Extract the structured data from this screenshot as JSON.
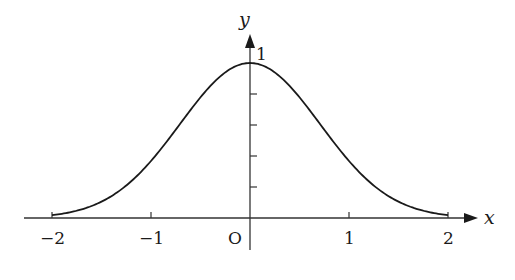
{
  "chart_data": {
    "type": "line",
    "title": "",
    "xlabel": "x",
    "ylabel": "y",
    "function": "y = e^(-x^2)",
    "xlim": [
      -2,
      2
    ],
    "ylim": [
      0,
      1
    ],
    "x_ticks": [
      -2,
      -1,
      0,
      1,
      2
    ],
    "x_tick_labels": [
      "−2",
      "−1",
      "O",
      "1",
      "2"
    ],
    "y_ticks": [
      0.2,
      0.4,
      0.6,
      0.8,
      1
    ],
    "y_tick_labels": [
      "1"
    ],
    "grid": false,
    "legend": null,
    "series": [
      {
        "name": "curve",
        "x": [
          -2,
          -1.5,
          -1,
          -0.5,
          0,
          0.5,
          1,
          1.5,
          2
        ],
        "values": [
          0.018,
          0.105,
          0.368,
          0.779,
          1.0,
          0.779,
          0.368,
          0.105,
          0.018
        ]
      }
    ]
  },
  "labels": {
    "x_axis": "x",
    "y_axis": "y",
    "origin": "O",
    "x_neg2": "−2",
    "x_neg1": "−1",
    "x_1": "1",
    "x_2": "2",
    "y_1": "1"
  },
  "colors": {
    "curve": "#1a1a1a",
    "axis": "#333333"
  }
}
